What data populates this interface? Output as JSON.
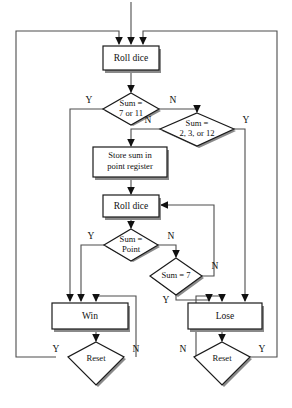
{
  "diagram": {
    "colors": {
      "background": "#ffffff",
      "shape_stroke": "#1a1a1a",
      "shape_fill": "#ffffff",
      "shadow": "#8a8a8a",
      "connector": "#4d4d4d",
      "arrowhead": "#111111",
      "text": "#111111"
    },
    "nodes": {
      "roll_dice_1": {
        "type": "process",
        "label": "Roll dice"
      },
      "sum_7_or_11": {
        "type": "decision",
        "label_line1": "Sum =",
        "label_line2": "7 or 11"
      },
      "sum_2_3_12": {
        "type": "decision",
        "label_line1": "Sum =",
        "label_line2": "2, 3, or 12"
      },
      "store_sum": {
        "type": "process",
        "label_line1": "Store sum in",
        "label_line2": "point register"
      },
      "roll_dice_2": {
        "type": "process",
        "label": "Roll dice"
      },
      "sum_point": {
        "type": "decision",
        "label_line1": "Sum =",
        "label_line2": "Point"
      },
      "sum_7": {
        "type": "decision",
        "label": "Sum = 7"
      },
      "win": {
        "type": "process",
        "label": "Win"
      },
      "lose": {
        "type": "process",
        "label": "Lose"
      },
      "reset_win": {
        "type": "decision",
        "label": "Reset"
      },
      "reset_lose": {
        "type": "decision",
        "label": "Reset"
      }
    },
    "branch_labels": {
      "sum_7_or_11_yes": "Y",
      "sum_7_or_11_no": "N",
      "sum_2_3_12_no": "N",
      "sum_2_3_12_yes": "Y",
      "sum_point_yes": "Y",
      "sum_point_no": "N",
      "sum_7_yes": "Y",
      "sum_7_no": "N",
      "reset_win_yes": "Y",
      "reset_win_no": "N",
      "reset_lose_no": "N",
      "reset_lose_yes": "Y"
    }
  }
}
